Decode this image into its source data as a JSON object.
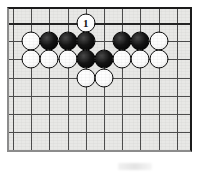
{
  "figure": {
    "kind": "go-board-diagram",
    "title": "",
    "caption": "",
    "board_colors": {
      "board_fill": "#e8e8e6",
      "grid_line": "#4d4d4d",
      "edge_line": "#242424",
      "black_stone": "#141414",
      "white_stone": "#ffffff",
      "stone_outline": "#0d0d0d",
      "page_background": "#ffffff"
    },
    "board": {
      "columns": 10,
      "rows": 8,
      "cell_size_px": 18.2,
      "top_edge_is_board_edge": true,
      "star_points": [
        {
          "col": 1,
          "row": 2
        },
        {
          "col": 7,
          "row": 2
        }
      ]
    },
    "stones": [
      {
        "id": "w-r1-c4",
        "color": "white",
        "col": 4,
        "row": 0,
        "label": "1",
        "is_move_marker": true
      },
      {
        "id": "w-r2-c1",
        "color": "white",
        "col": 1,
        "row": 1,
        "label": "",
        "is_move_marker": false
      },
      {
        "id": "b-r2-c2",
        "color": "black",
        "col": 2,
        "row": 1,
        "label": "",
        "is_move_marker": false
      },
      {
        "id": "b-r2-c3",
        "color": "black",
        "col": 3,
        "row": 1,
        "label": "",
        "is_move_marker": false
      },
      {
        "id": "b-r2-c4",
        "color": "black",
        "col": 4,
        "row": 1,
        "label": "",
        "is_move_marker": false
      },
      {
        "id": "b-r2-c6",
        "color": "black",
        "col": 6,
        "row": 1,
        "label": "",
        "is_move_marker": false
      },
      {
        "id": "b-r2-c7",
        "color": "black",
        "col": 7,
        "row": 1,
        "label": "",
        "is_move_marker": false
      },
      {
        "id": "w-r2-c8",
        "color": "white",
        "col": 8,
        "row": 1,
        "label": "",
        "is_move_marker": false
      },
      {
        "id": "w-r3-c1",
        "color": "white",
        "col": 1,
        "row": 2,
        "label": "",
        "is_move_marker": false
      },
      {
        "id": "w-r3-c2",
        "color": "white",
        "col": 2,
        "row": 2,
        "label": "",
        "is_move_marker": false
      },
      {
        "id": "w-r3-c3",
        "color": "white",
        "col": 3,
        "row": 2,
        "label": "",
        "is_move_marker": false
      },
      {
        "id": "b-r3-c4",
        "color": "black",
        "col": 4,
        "row": 2,
        "label": "",
        "is_move_marker": false
      },
      {
        "id": "b-r3-c5",
        "color": "black",
        "col": 5,
        "row": 2,
        "label": "",
        "is_move_marker": false
      },
      {
        "id": "w-r3-c6",
        "color": "white",
        "col": 6,
        "row": 2,
        "label": "",
        "is_move_marker": false
      },
      {
        "id": "w-r3-c7",
        "color": "white",
        "col": 7,
        "row": 2,
        "label": "",
        "is_move_marker": false
      },
      {
        "id": "w-r3-c8",
        "color": "white",
        "col": 8,
        "row": 2,
        "label": "",
        "is_move_marker": false
      },
      {
        "id": "w-r4-c4",
        "color": "white",
        "col": 4,
        "row": 3,
        "label": "",
        "is_move_marker": false
      },
      {
        "id": "w-r4-c5",
        "color": "white",
        "col": 5,
        "row": 3,
        "label": "",
        "is_move_marker": false
      }
    ]
  }
}
